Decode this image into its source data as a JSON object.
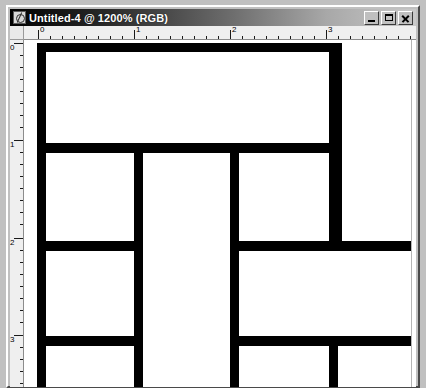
{
  "window": {
    "title": "Untitled-4 @ 1200% (RGB)",
    "icon": "photoshop-document-icon",
    "controls": {
      "minimize": "minimize-button",
      "maximize": "maximize-button",
      "close": "close-button"
    }
  },
  "rulers": {
    "unit_labels_horizontal": [
      "0",
      "1",
      "2",
      "3"
    ],
    "unit_labels_vertical": [
      "0",
      "1",
      "2",
      "3"
    ],
    "horizontal_label_positions": [
      14,
      110,
      206,
      302
    ],
    "vertical_label_positions": [
      3,
      100,
      198,
      295
    ],
    "ticks_per_unit": 8,
    "unit_spacing_px": 96
  },
  "canvas": {
    "zoom_level": "1200%",
    "color_mode": "RGB",
    "background": "#ffffff",
    "ink": "#000000",
    "description": "black rectangular maze-like grid pattern",
    "bars": [
      {
        "name": "top-horizontal-bar",
        "x": 13,
        "y": 3,
        "w": 305,
        "h": 9
      },
      {
        "name": "left-vertical-bar",
        "x": 13,
        "y": 3,
        "w": 9,
        "h": 344
      },
      {
        "name": "right-upper-vertical-bar",
        "x": 305,
        "y": 3,
        "w": 13,
        "h": 200
      },
      {
        "name": "first-horizontal-divider",
        "x": 13,
        "y": 103,
        "w": 305,
        "h": 10
      },
      {
        "name": "middle-left-vertical-bar",
        "x": 110,
        "y": 103,
        "w": 9,
        "h": 244
      },
      {
        "name": "middle-right-vertical-bar",
        "x": 206,
        "y": 103,
        "w": 9,
        "h": 244
      },
      {
        "name": "second-horizontal-divider-left",
        "x": 13,
        "y": 201,
        "w": 106,
        "h": 10
      },
      {
        "name": "second-horizontal-divider-right",
        "x": 206,
        "y": 201,
        "w": 186,
        "h": 10
      },
      {
        "name": "third-horizontal-divider-left",
        "x": 13,
        "y": 296,
        "w": 106,
        "h": 10
      },
      {
        "name": "third-horizontal-divider-right",
        "x": 206,
        "y": 296,
        "w": 186,
        "h": 10
      },
      {
        "name": "bottom-right-vertical-stub",
        "x": 305,
        "y": 306,
        "w": 9,
        "h": 41
      }
    ]
  },
  "scrollbar": {
    "name": "vertical-scrollbar"
  }
}
